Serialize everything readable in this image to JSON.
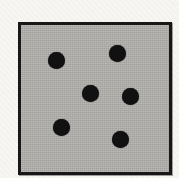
{
  "figure": {
    "background_color": "#f7f6f2",
    "square": {
      "fill_color": "#b3b1ae",
      "border_color": "#181818",
      "left": 18,
      "top": 22,
      "width": 154,
      "height": 153,
      "border_width": 3
    },
    "dots": {
      "color": "#111111",
      "radius": 8.5,
      "count": 6,
      "positions": [
        {
          "x": 56,
          "y": 60
        },
        {
          "x": 117,
          "y": 53
        },
        {
          "x": 90,
          "y": 93
        },
        {
          "x": 130,
          "y": 96
        },
        {
          "x": 61,
          "y": 127
        },
        {
          "x": 120,
          "y": 139
        }
      ]
    }
  }
}
